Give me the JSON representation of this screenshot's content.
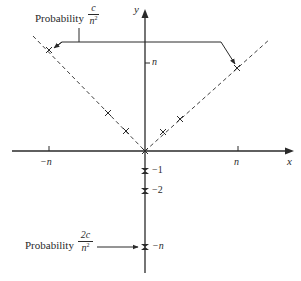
{
  "figure": {
    "axes": {
      "x_label": "x",
      "y_label": "y",
      "x_ticks": [
        {
          "label": "−n",
          "value": "-n"
        },
        {
          "label": "n",
          "value": "n"
        }
      ],
      "y_ticks": [
        {
          "label": "n",
          "value": "n"
        },
        {
          "label": "−1",
          "value": "-1"
        },
        {
          "label": "−2",
          "value": "-2"
        },
        {
          "label": "−n",
          "value": "-n"
        }
      ]
    },
    "annotations": {
      "top": {
        "text": "Probability",
        "fraction_numerator": "c",
        "fraction_denominator": "n",
        "fraction_denominator_exponent": "2"
      },
      "bottom": {
        "text": "Probability",
        "fraction_numerator": "2c",
        "fraction_denominator": "n",
        "fraction_denominator_exponent": "2"
      }
    },
    "lines": [
      {
        "name": "y = -x (x<0) dashed",
        "style": "dashed"
      },
      {
        "name": "y = x (x>0) dashed",
        "style": "dashed"
      }
    ],
    "markers": {
      "diagonal_left": [
        "(-n, n)",
        "(-2, 2)",
        "(-1, 1)"
      ],
      "diagonal_right": [
        "(1, 1)",
        "(2, 2)",
        "(n, n)"
      ],
      "y_axis": [
        "(0, -1)",
        "(0, -2)",
        "(0, -n)"
      ],
      "origin": "(0, 0)"
    }
  }
}
